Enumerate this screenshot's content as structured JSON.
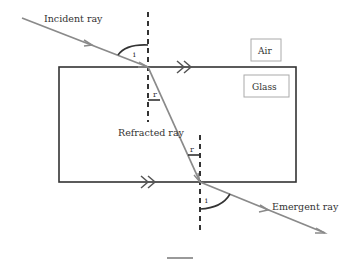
{
  "diagram": {
    "labels": {
      "incident_ray": "Incident ray",
      "refracted_ray": "Refracted ray",
      "emergent_ray": "Emergent ray",
      "air": "Air",
      "glass": "Glass",
      "angle_incidence_top": "i",
      "angle_refraction_top": "r",
      "angle_refraction_bottom": "r",
      "angle_emergence_bottom": "i"
    },
    "colors": {
      "ray": "#8a8a8a",
      "slab_border": "#333333",
      "normal": "#333333",
      "label_box": "#aaaaaa",
      "text": "#333333"
    }
  }
}
